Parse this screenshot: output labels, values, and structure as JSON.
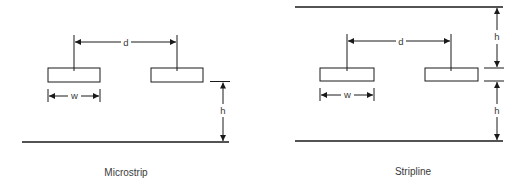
{
  "diagrams": [
    {
      "id": "microstrip",
      "caption": "Microstrip",
      "labels": {
        "spacing": "d",
        "width": "w",
        "height": "h"
      }
    },
    {
      "id": "stripline",
      "caption": "Stripline",
      "labels": {
        "spacing": "d",
        "width": "w",
        "height_top": "h",
        "height_bottom": "h"
      }
    }
  ],
  "colors": {
    "line": "#1a1a1a",
    "text": "#3a3a3a",
    "background": "#ffffff"
  }
}
